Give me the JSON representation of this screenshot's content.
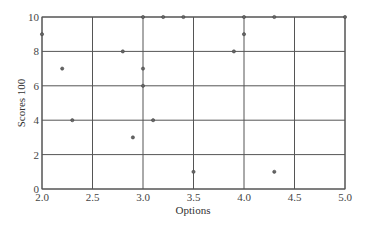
{
  "chart_data": {
    "type": "scatter",
    "title": "",
    "xlabel": "Options",
    "ylabel": "Scores 100",
    "xlim": [
      2.0,
      5.0
    ],
    "ylim": [
      0,
      10
    ],
    "xticks": [
      "2.0",
      "2.5",
      "3.0",
      "3.5",
      "4.0",
      "4.5",
      "5.0"
    ],
    "yticks": [
      "0",
      "2",
      "4",
      "6",
      "8",
      "10"
    ],
    "grid": true,
    "legend": null,
    "points": [
      {
        "x": 2.0,
        "y": 9
      },
      {
        "x": 2.2,
        "y": 7
      },
      {
        "x": 2.3,
        "y": 4
      },
      {
        "x": 2.8,
        "y": 8
      },
      {
        "x": 2.9,
        "y": 3
      },
      {
        "x": 3.0,
        "y": 10
      },
      {
        "x": 3.0,
        "y": 7
      },
      {
        "x": 3.0,
        "y": 6
      },
      {
        "x": 3.1,
        "y": 4
      },
      {
        "x": 3.2,
        "y": 10
      },
      {
        "x": 3.4,
        "y": 10
      },
      {
        "x": 3.5,
        "y": 1
      },
      {
        "x": 3.9,
        "y": 8
      },
      {
        "x": 4.0,
        "y": 10
      },
      {
        "x": 4.0,
        "y": 9
      },
      {
        "x": 4.3,
        "y": 10
      },
      {
        "x": 4.3,
        "y": 1
      },
      {
        "x": 5.0,
        "y": 10
      }
    ],
    "colors": {
      "grid": "#555555",
      "marker": "#666666",
      "axis": "#555555"
    }
  }
}
